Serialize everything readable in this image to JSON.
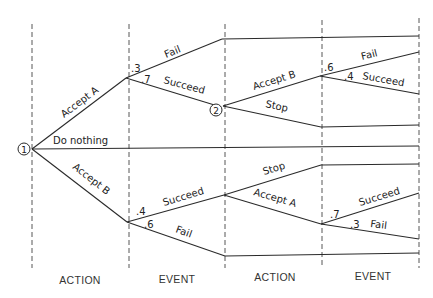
{
  "diagram": {
    "type": "decision-tree",
    "nodes": {
      "n1": {
        "label": "1",
        "x": 24,
        "y": 149
      },
      "n2": {
        "label": "2",
        "x": 216,
        "y": 110
      }
    },
    "columns": [
      {
        "label": "ACTION",
        "x": 80
      },
      {
        "label": "EVENT",
        "x": 177
      },
      {
        "label": "ACTION",
        "x": 273
      },
      {
        "label": "EVENT",
        "x": 371
      }
    ],
    "branches": {
      "accept_a": "Accept A",
      "do_nothing": "Do nothing",
      "accept_b": "Accept B",
      "fail_top": "Fail",
      "succeed_top": "Succeed",
      "accept_b_2": "Accept B",
      "stop_2": "Stop",
      "fail_b2": "Fail",
      "succeed_b2": "Succeed",
      "succeed_low": "Succeed",
      "fail_low": "Fail",
      "stop_low": "Stop",
      "accept_a_low": "Accept A",
      "succeed_a_low": "Succeed",
      "fail_a_low": "Fail"
    },
    "probabilities": {
      "fail_top": ".3",
      "succeed_top": ".7",
      "fail_b2": ".6",
      "succeed_b2": ".4",
      "succeed_low": ".4",
      "fail_low": ".6",
      "succeed_a_low": ".7",
      "fail_a_low": ".3"
    }
  }
}
